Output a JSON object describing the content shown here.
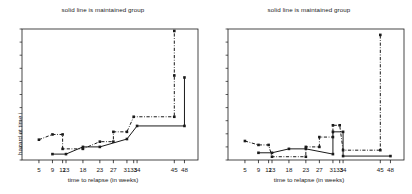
{
  "figure": {
    "width": 412,
    "height": 194,
    "background": "#ffffff",
    "ink": "#1a1a1a"
  },
  "chart_data": [
    {
      "id": "left",
      "type": "line",
      "title": "solid line is maintained group",
      "xlabel": "time to relapse (in weeks)",
      "ylabel": "hazard at time i",
      "xlim": [
        0,
        52
      ],
      "ylim": [
        0,
        1
      ],
      "grid": false,
      "legend": "none",
      "xticks": [
        5,
        9,
        12,
        13,
        18,
        23,
        27,
        31,
        33,
        34,
        45,
        48
      ],
      "xticklabels": [
        "5",
        "9",
        "12",
        "13",
        "18",
        "23",
        "27",
        "31",
        "33",
        "34",
        "45",
        "48"
      ],
      "yticks": [],
      "yticklabels": [],
      "series": [
        {
          "name": "maintained group",
          "style": "solid",
          "marker": "square",
          "points": [
            {
              "x": 9,
              "y": 0.045
            },
            {
              "x": 13,
              "y": 0.045
            },
            {
              "x": 18,
              "y": 0.1
            },
            {
              "x": 23,
              "y": 0.1
            },
            {
              "x": 31,
              "y": 0.16
            },
            {
              "x": 34,
              "y": 0.26
            },
            {
              "x": 48,
              "y": 0.26
            },
            {
              "x": 48,
              "y": 0.63
            }
          ]
        },
        {
          "name": "nonmaintained group",
          "style": "dashdot",
          "marker": "square",
          "points": [
            {
              "x": 5,
              "y": 0.155
            },
            {
              "x": 9,
              "y": 0.195
            },
            {
              "x": 12,
              "y": 0.195
            },
            {
              "x": 12,
              "y": 0.085
            },
            {
              "x": 18,
              "y": 0.085
            },
            {
              "x": 23,
              "y": 0.14
            },
            {
              "x": 27,
              "y": 0.14
            },
            {
              "x": 27,
              "y": 0.215
            },
            {
              "x": 31,
              "y": 0.215
            },
            {
              "x": 33,
              "y": 0.33
            },
            {
              "x": 45,
              "y": 0.33
            },
            {
              "x": 45,
              "y": 0.645
            },
            {
              "x": 45,
              "y": 0.985
            }
          ]
        }
      ]
    },
    {
      "id": "right",
      "type": "line",
      "title": "solid line is maintained group",
      "xlabel": "time to relapse (in weeks)",
      "ylabel": "hazard over each observed interval",
      "xlim": [
        0,
        52
      ],
      "ylim": [
        0,
        1
      ],
      "grid": false,
      "legend": "none",
      "xticks": [
        5,
        9,
        12,
        13,
        18,
        23,
        27,
        31,
        33,
        34,
        45,
        48
      ],
      "xticklabels": [
        "5",
        "9",
        "12",
        "13",
        "18",
        "23",
        "27",
        "31",
        "33",
        "34",
        "45",
        "48"
      ],
      "yticks": [],
      "yticklabels": [],
      "series": [
        {
          "name": "maintained group",
          "style": "solid",
          "marker": "square",
          "points": [
            {
              "x": 9,
              "y": 0.055
            },
            {
              "x": 13,
              "y": 0.055
            },
            {
              "x": 18,
              "y": 0.085
            },
            {
              "x": 23,
              "y": 0.085
            },
            {
              "x": 31,
              "y": 0.045
            },
            {
              "x": 31,
              "y": 0.215
            },
            {
              "x": 34,
              "y": 0.215
            },
            {
              "x": 34,
              "y": 0.03
            },
            {
              "x": 48,
              "y": 0.03
            }
          ]
        },
        {
          "name": "nonmaintained group",
          "style": "dashdot",
          "marker": "square",
          "points": [
            {
              "x": 5,
              "y": 0.145
            },
            {
              "x": 9,
              "y": 0.115
            },
            {
              "x": 12,
              "y": 0.115
            },
            {
              "x": 13,
              "y": 0.025
            },
            {
              "x": 23,
              "y": 0.025
            },
            {
              "x": 23,
              "y": 0.1
            },
            {
              "x": 27,
              "y": 0.1
            },
            {
              "x": 27,
              "y": 0.175
            },
            {
              "x": 31,
              "y": 0.175
            },
            {
              "x": 31,
              "y": 0.265
            },
            {
              "x": 33,
              "y": 0.265
            },
            {
              "x": 34,
              "y": 0.075
            },
            {
              "x": 45,
              "y": 0.075
            },
            {
              "x": 45,
              "y": 0.955
            }
          ]
        }
      ]
    }
  ]
}
